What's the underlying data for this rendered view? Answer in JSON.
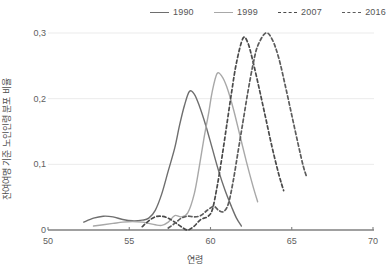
{
  "chart_data": {
    "type": "line",
    "title": "",
    "xlabel": "연령",
    "ylabel": "잔여여명 기준 노인인령 분포 비율",
    "xlim": [
      50,
      70
    ],
    "ylim": [
      0,
      0.32
    ],
    "xticks": [
      "50",
      "55",
      "60",
      "65",
      "70"
    ],
    "xtick_values": [
      50,
      55,
      60,
      65,
      70
    ],
    "yticks": [
      "0",
      "0,1",
      "0,2",
      "0,3"
    ],
    "ytick_values": [
      0,
      0.1,
      0.2,
      0.3
    ],
    "grid": "horizontal",
    "legend_position": "top",
    "decimal_separator": ",",
    "series": [
      {
        "name": "1990",
        "color": "#6e6e6e",
        "style": "solid",
        "peak_x": 58.7,
        "peak_y": 0.211,
        "points": [
          [
            52.2,
            0.012
          ],
          [
            52.8,
            0.018
          ],
          [
            53.4,
            0.021
          ],
          [
            54.0,
            0.02
          ],
          [
            54.6,
            0.016
          ],
          [
            55.2,
            0.014
          ],
          [
            55.8,
            0.015
          ],
          [
            56.2,
            0.018
          ],
          [
            56.6,
            0.03
          ],
          [
            57.0,
            0.055
          ],
          [
            57.4,
            0.09
          ],
          [
            57.8,
            0.125
          ],
          [
            58.1,
            0.16
          ],
          [
            58.4,
            0.19
          ],
          [
            58.7,
            0.211
          ],
          [
            59.0,
            0.207
          ],
          [
            59.3,
            0.19
          ],
          [
            59.7,
            0.16
          ],
          [
            60.1,
            0.125
          ],
          [
            60.5,
            0.09
          ],
          [
            60.9,
            0.06
          ],
          [
            61.3,
            0.035
          ],
          [
            61.6,
            0.018
          ],
          [
            61.9,
            0.006
          ]
        ]
      },
      {
        "name": "1999",
        "color": "#a8a8a8",
        "style": "solid",
        "peak_x": 60.4,
        "peak_y": 0.238,
        "points": [
          [
            52.8,
            0.006
          ],
          [
            53.4,
            0.008
          ],
          [
            54.0,
            0.01
          ],
          [
            54.6,
            0.012
          ],
          [
            55.2,
            0.013
          ],
          [
            55.8,
            0.012
          ],
          [
            56.2,
            0.01
          ],
          [
            56.6,
            0.008
          ],
          [
            57.0,
            0.007
          ],
          [
            57.4,
            0.012
          ],
          [
            57.8,
            0.022
          ],
          [
            58.2,
            0.02
          ],
          [
            58.6,
            0.026
          ],
          [
            59.0,
            0.055
          ],
          [
            59.3,
            0.095
          ],
          [
            59.6,
            0.14
          ],
          [
            59.9,
            0.18
          ],
          [
            60.1,
            0.21
          ],
          [
            60.4,
            0.238
          ],
          [
            60.7,
            0.234
          ],
          [
            61.0,
            0.218
          ],
          [
            61.4,
            0.185
          ],
          [
            61.8,
            0.145
          ],
          [
            62.2,
            0.105
          ],
          [
            62.6,
            0.068
          ],
          [
            62.9,
            0.043
          ]
        ]
      },
      {
        "name": "2007",
        "color": "#4a4a4a",
        "style": "dashed",
        "peak_x": 62.0,
        "peak_y": 0.292,
        "points": [
          [
            55.8,
            0.005
          ],
          [
            56.2,
            0.014
          ],
          [
            56.6,
            0.02
          ],
          [
            57.0,
            0.021
          ],
          [
            57.4,
            0.018
          ],
          [
            57.8,
            0.012
          ],
          [
            58.2,
            0.005
          ],
          [
            58.6,
            0.0
          ],
          [
            59.0,
            0.006
          ],
          [
            59.4,
            0.016
          ],
          [
            59.8,
            0.02
          ],
          [
            60.1,
            0.03
          ],
          [
            60.4,
            0.065
          ],
          [
            60.7,
            0.11
          ],
          [
            61.0,
            0.16
          ],
          [
            61.3,
            0.21
          ],
          [
            61.6,
            0.255
          ],
          [
            62.0,
            0.292
          ],
          [
            62.3,
            0.285
          ],
          [
            62.6,
            0.258
          ],
          [
            63.0,
            0.215
          ],
          [
            63.4,
            0.17
          ],
          [
            63.8,
            0.125
          ],
          [
            64.2,
            0.085
          ],
          [
            64.5,
            0.06
          ]
        ]
      },
      {
        "name": "2016",
        "color": "#5c5c5c",
        "style": "dashed",
        "peak_x": 63.4,
        "peak_y": 0.3,
        "points": [
          [
            57.4,
            0.003
          ],
          [
            57.8,
            0.01
          ],
          [
            58.2,
            0.018
          ],
          [
            58.6,
            0.021
          ],
          [
            59.0,
            0.02
          ],
          [
            59.4,
            0.022
          ],
          [
            59.8,
            0.03
          ],
          [
            60.2,
            0.036
          ],
          [
            60.5,
            0.03
          ],
          [
            60.8,
            0.028
          ],
          [
            61.1,
            0.04
          ],
          [
            61.4,
            0.075
          ],
          [
            61.7,
            0.12
          ],
          [
            62.0,
            0.165
          ],
          [
            62.3,
            0.21
          ],
          [
            62.6,
            0.25
          ],
          [
            62.9,
            0.28
          ],
          [
            63.4,
            0.3
          ],
          [
            63.8,
            0.29
          ],
          [
            64.2,
            0.262
          ],
          [
            64.6,
            0.22
          ],
          [
            65.0,
            0.175
          ],
          [
            65.4,
            0.13
          ],
          [
            65.7,
            0.098
          ],
          [
            65.9,
            0.082
          ]
        ]
      }
    ]
  },
  "legend": {
    "entries": [
      {
        "label": "1990"
      },
      {
        "label": "1999"
      },
      {
        "label": "2007"
      },
      {
        "label": "2016"
      }
    ]
  },
  "colors": {
    "axis": "#808080",
    "grid": "#ebebeb",
    "text": "#5a5a5a"
  }
}
